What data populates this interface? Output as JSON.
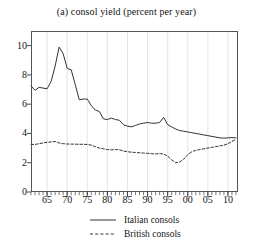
{
  "chart_data": {
    "type": "line",
    "title": "(a) consol yield (percent per year)",
    "xlabel": "",
    "ylabel": "",
    "xlim": [
      1961,
      2012.5
    ],
    "ylim": [
      0,
      11
    ],
    "yticks": [
      0,
      2,
      4,
      6,
      8,
      10
    ],
    "ytick_labels": [
      "0",
      "2",
      "4",
      "6",
      "8",
      "10"
    ],
    "xticks": [
      1965,
      1970,
      1975,
      1980,
      1985,
      1990,
      1995,
      2000,
      2005,
      2010
    ],
    "xtick_labels": [
      "65",
      "70",
      "75",
      "80",
      "85",
      "90",
      "95",
      "00",
      "05",
      "10"
    ],
    "minor_xtick_interval": 1,
    "grid": true,
    "grid_axis": "x",
    "legend_position": "below",
    "units": "percent per year",
    "x": [
      1961,
      1962,
      1963,
      1964,
      1965,
      1966,
      1967,
      1968,
      1969,
      1970,
      1971,
      1972,
      1973,
      1974,
      1975,
      1976,
      1977,
      1978,
      1979,
      1980,
      1981,
      1982,
      1983,
      1984,
      1985,
      1986,
      1987,
      1988,
      1989,
      1990,
      1991,
      1992,
      1993,
      1994,
      1995,
      1996,
      1997,
      1998,
      1999,
      2000,
      2001,
      2002,
      2003,
      2004,
      2005,
      2006,
      2007,
      2008,
      2009,
      2010,
      2011,
      2012
    ],
    "series": [
      {
        "name": "Italian consols",
        "style": "solid",
        "color": "#333333",
        "values": [
          7.25,
          6.95,
          7.15,
          7.1,
          7.05,
          7.55,
          8.6,
          9.9,
          9.45,
          8.45,
          8.35,
          7.35,
          6.3,
          6.35,
          6.35,
          5.9,
          5.6,
          5.5,
          5.0,
          4.95,
          5.05,
          4.95,
          4.9,
          4.6,
          4.5,
          4.45,
          4.55,
          4.65,
          4.7,
          4.75,
          4.7,
          4.7,
          4.75,
          5.1,
          4.6,
          4.45,
          4.3,
          4.2,
          4.15,
          4.1,
          4.05,
          4.0,
          3.95,
          3.9,
          3.85,
          3.8,
          3.75,
          3.7,
          3.68,
          3.7,
          3.72,
          3.7
        ]
      },
      {
        "name": "British consols",
        "style": "dashed",
        "color": "#333333",
        "values": [
          3.25,
          3.25,
          3.3,
          3.35,
          3.4,
          3.42,
          3.45,
          3.35,
          3.3,
          3.28,
          3.27,
          3.27,
          3.26,
          3.26,
          3.25,
          3.2,
          3.1,
          3.0,
          2.95,
          2.9,
          2.88,
          2.9,
          2.88,
          2.8,
          2.75,
          2.72,
          2.7,
          2.68,
          2.66,
          2.64,
          2.62,
          2.6,
          2.62,
          2.6,
          2.45,
          2.2,
          2.0,
          2.05,
          2.25,
          2.55,
          2.75,
          2.85,
          2.9,
          2.95,
          3.0,
          3.05,
          3.1,
          3.15,
          3.2,
          3.3,
          3.45,
          3.6
        ]
      }
    ]
  },
  "legend": {
    "items": [
      {
        "label": "Italian consols",
        "style": "solid"
      },
      {
        "label": "British consols",
        "style": "dashed"
      }
    ]
  }
}
